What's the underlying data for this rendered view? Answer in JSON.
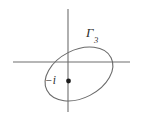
{
  "figure": {
    "type": "complex-plane-contour-diagram",
    "background_color": "#ffffff",
    "width": 142,
    "height": 116,
    "labels": {
      "contour_name": "Γ",
      "contour_subscript": "3",
      "contour_full": "Γ3",
      "point_label": "−i"
    },
    "axes": {
      "line_color": "#6e6e6e",
      "horizontal": {
        "x1": 13,
        "y1": 62,
        "x2": 130,
        "y2": 62
      },
      "vertical": {
        "x1": 68,
        "y1": 9,
        "x2": 68,
        "y2": 112
      },
      "origin": {
        "x": 68,
        "y": 62
      }
    },
    "contour": {
      "shape": "ellipse",
      "stroke_color": "#6a6a6a",
      "center": {
        "x": 79,
        "y": 74
      },
      "radius_major": 36,
      "radius_minor": 24,
      "rotation_deg": -27
    },
    "marked_point": {
      "name": "minus-i",
      "x": 68,
      "y": 81,
      "radius": 2.4,
      "color": "#1d1d1d"
    }
  }
}
